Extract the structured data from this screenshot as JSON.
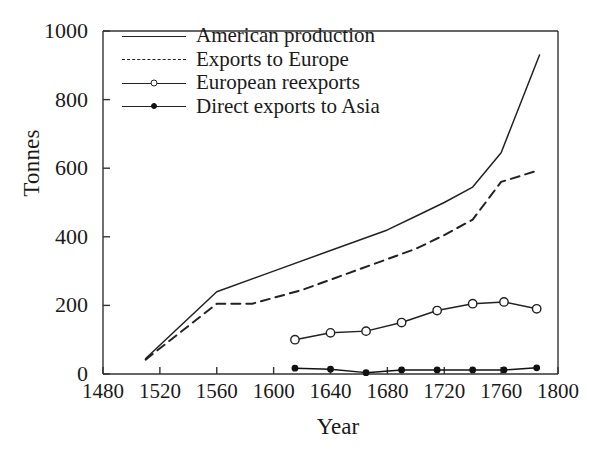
{
  "chart_data": {
    "type": "line",
    "title": "",
    "xlabel": "Year",
    "ylabel": "Tonnes",
    "xlim": [
      1480,
      1800
    ],
    "ylim": [
      0,
      1000
    ],
    "xticks": [
      1480,
      1520,
      1560,
      1600,
      1640,
      1680,
      1720,
      1760,
      1800
    ],
    "yticks": [
      0,
      200,
      400,
      600,
      800,
      1000
    ],
    "grid": false,
    "legend_position": "top-left-inside",
    "series": [
      {
        "name": "American production",
        "style": "solid",
        "marker": "none",
        "color": "#222222",
        "x": [
          1510,
          1560,
          1600,
          1640,
          1680,
          1700,
          1720,
          1740,
          1760,
          1787
        ],
        "y": [
          45,
          240,
          300,
          360,
          420,
          460,
          500,
          545,
          645,
          930
        ]
      },
      {
        "name": "Exports to Europe",
        "style": "dashed",
        "marker": "none",
        "color": "#222222",
        "x": [
          1510,
          1560,
          1585,
          1620,
          1660,
          1700,
          1720,
          1740,
          1760,
          1787
        ],
        "y": [
          42,
          205,
          205,
          245,
          305,
          365,
          405,
          450,
          560,
          595
        ]
      },
      {
        "name": "European reexports",
        "style": "solid",
        "marker": "open-circle",
        "color": "#222222",
        "x": [
          1615,
          1640,
          1665,
          1690,
          1715,
          1740,
          1762,
          1785
        ],
        "y": [
          100,
          120,
          125,
          150,
          185,
          205,
          210,
          190
        ]
      },
      {
        "name": "Direct exports to Asia",
        "style": "solid",
        "marker": "filled-circle",
        "color": "#111111",
        "x": [
          1615,
          1640,
          1665,
          1690,
          1715,
          1740,
          1762,
          1785
        ],
        "y": [
          17,
          14,
          4,
          12,
          12,
          12,
          12,
          18
        ]
      }
    ]
  },
  "axes": {
    "ylabel": "Tonnes",
    "xlabel": "Year",
    "xticklabels": [
      "1480",
      "1520",
      "1560",
      "1600",
      "1640",
      "1680",
      "1720",
      "1760",
      "1800"
    ],
    "yticklabels": [
      "0",
      "200",
      "400",
      "600",
      "800",
      "1000"
    ]
  },
  "legend": {
    "items": [
      {
        "label": "American production"
      },
      {
        "label": "Exports to Europe"
      },
      {
        "label": "European reexports"
      },
      {
        "label": "Direct exports to Asia"
      }
    ]
  }
}
